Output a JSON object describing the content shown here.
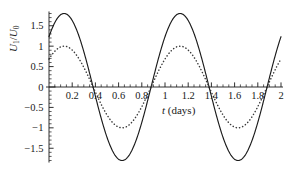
{
  "chart_data": {
    "type": "line",
    "title": "",
    "xlabel": "t (days)",
    "ylabel": "U1/U0",
    "ylabel_parts": {
      "numerator": "U",
      "numerator_sub": "1",
      "denominator": "U",
      "denominator_sub": "0"
    },
    "xlabel_parts": {
      "symbol": "t",
      "unit": "(days)"
    },
    "xlim": [
      0,
      2
    ],
    "ylim": [
      -1.85,
      1.85
    ],
    "xticks": [
      0.2,
      0.4,
      0.6,
      0.8,
      1,
      1.2,
      1.4,
      1.6,
      1.8,
      2
    ],
    "xticklabels": [
      "0.2",
      "0.4",
      "0.6",
      "0.8",
      "1",
      "1.2",
      "1.4",
      "1.6",
      "1.8",
      "2"
    ],
    "yticks": [
      1.5,
      1,
      0.5,
      0,
      -0.5,
      -1,
      -1.5
    ],
    "yticklabels": [
      "1.5",
      "1",
      "0.5",
      "0",
      "−0.5",
      "−1",
      "−1.5"
    ],
    "x_minor_tick_step": 0.05,
    "y_minor_tick_step": 0.1,
    "grid": false,
    "legend": "none",
    "axis_style": "zero-crossing-spines",
    "series": [
      {
        "name": "solid-curve",
        "style": "solid",
        "color": "#1a1a1a",
        "amplitude": 1.8,
        "period": 1.0,
        "phase_peak_t": 0.13,
        "key_points": [
          {
            "t": 0.0,
            "y": 1.28
          },
          {
            "t": 0.13,
            "y": 1.8
          },
          {
            "t": 0.38,
            "y": 0.0
          },
          {
            "t": 0.63,
            "y": -1.8
          },
          {
            "t": 0.88,
            "y": 0.0
          },
          {
            "t": 1.13,
            "y": 1.8
          },
          {
            "t": 1.38,
            "y": 0.0
          },
          {
            "t": 1.63,
            "y": -1.8
          },
          {
            "t": 1.88,
            "y": 0.0
          },
          {
            "t": 2.0,
            "y": 1.2
          }
        ]
      },
      {
        "name": "dotted-curve",
        "style": "dotted",
        "color": "#3a3a3a",
        "amplitude": 1.0,
        "period": 1.0,
        "phase_peak_t": 0.13,
        "key_points": [
          {
            "t": 0.0,
            "y": 0.82
          },
          {
            "t": 0.13,
            "y": 1.0
          },
          {
            "t": 0.38,
            "y": 0.0
          },
          {
            "t": 0.63,
            "y": -1.0
          },
          {
            "t": 0.88,
            "y": 0.0
          },
          {
            "t": 1.13,
            "y": 1.0
          },
          {
            "t": 1.38,
            "y": 0.0
          },
          {
            "t": 1.63,
            "y": -1.0
          },
          {
            "t": 1.88,
            "y": 0.0
          },
          {
            "t": 2.0,
            "y": 0.66
          }
        ]
      }
    ]
  }
}
